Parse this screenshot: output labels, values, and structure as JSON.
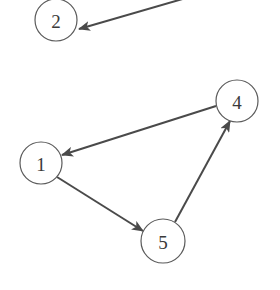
{
  "graph": {
    "type": "directed-graph",
    "colors": {
      "node_stroke": "#5a5a5a",
      "edge": "#4a4a4a",
      "label": "#3a3a3a",
      "background": "#ffffff"
    },
    "nodes": [
      {
        "id": "2",
        "label": "2",
        "x": 56,
        "y": 20
      },
      {
        "id": "4",
        "label": "4",
        "x": 237,
        "y": 101
      },
      {
        "id": "1",
        "label": "1",
        "x": 41,
        "y": 163
      },
      {
        "id": "5",
        "label": "5",
        "x": 163,
        "y": 241
      }
    ],
    "edges": [
      {
        "from": "offscreen",
        "to": "2"
      },
      {
        "from": "4",
        "to": "1"
      },
      {
        "from": "1",
        "to": "5"
      },
      {
        "from": "5",
        "to": "4"
      }
    ]
  }
}
